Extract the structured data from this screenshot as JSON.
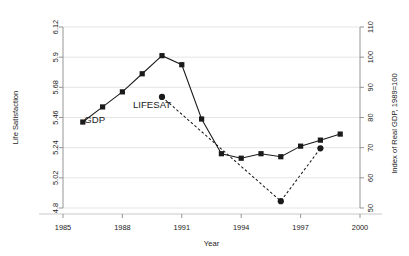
{
  "figure": {
    "top_note": "",
    "background": "#ffffff"
  },
  "chart_data": {
    "type": "line",
    "title": "",
    "xlabel": "Year",
    "ylabel": "Life Satisfaction",
    "y2label": "Index of Real GDP, 1989=100",
    "xlim": [
      1985,
      2000
    ],
    "ylim": [
      4.8,
      6.12
    ],
    "y2lim": [
      50,
      110
    ],
    "grid": true,
    "grid_axis": "y",
    "legend": "inline-annotations",
    "xticks": [
      "1985",
      "1988",
      "1991",
      "1994",
      "1997",
      "2000"
    ],
    "xtick_values": [
      1985,
      1988,
      1991,
      1994,
      1997,
      2000
    ],
    "yticks": [
      "4.8",
      "5.02",
      "5.24",
      "5.46",
      "5.68",
      "5.9",
      "6.12"
    ],
    "ytick_values": [
      4.8,
      5.02,
      5.24,
      5.46,
      5.68,
      5.9,
      6.12
    ],
    "y2ticks": [
      "50",
      "60",
      "70",
      "80",
      "90",
      "100",
      "110"
    ],
    "y2tick_values": [
      50,
      60,
      70,
      80,
      90,
      100,
      110
    ],
    "annotations": [
      {
        "text": "GDP",
        "x": 1986.6,
        "y": 5.42
      },
      {
        "text": "LIFESAT",
        "x": 1989.5,
        "y": 5.53
      }
    ],
    "series": [
      {
        "name": "GDP",
        "label": "GDP",
        "axis": "right",
        "marker": "square",
        "linestyle": "solid",
        "color": "#1a1a1a",
        "x": [
          1986,
          1987,
          1988,
          1989,
          1990,
          1991,
          1992,
          1993,
          1994,
          1995,
          1996,
          1997,
          1998,
          1999
        ],
        "values": [
          78.5,
          83.5,
          88.5,
          94.5,
          100.5,
          97.5,
          79.5,
          68.0,
          66.5,
          68.0,
          67.0,
          70.5,
          72.5,
          74.5
        ]
      },
      {
        "name": "LIFESAT",
        "label": "LIFESAT",
        "axis": "left",
        "marker": "circle",
        "linestyle": "dashed",
        "color": "#1a1a1a",
        "x": [
          1990,
          1996,
          1998
        ],
        "values": [
          5.61,
          4.85,
          5.235
        ]
      }
    ]
  }
}
